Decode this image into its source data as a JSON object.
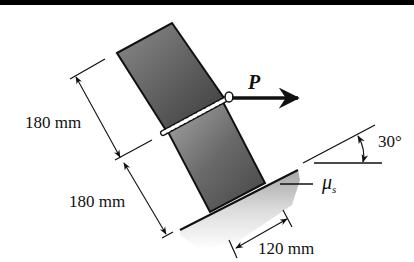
{
  "figure": {
    "top_border_color": "#000000",
    "block_color_top": "#6e6e6e",
    "block_color_bottom": "#3a3a3a",
    "outline_color": "#111111"
  },
  "labels": {
    "force": "P",
    "dim_upper": "180 mm",
    "dim_lower": "180 mm",
    "dim_base": "120 mm",
    "angle": "30°",
    "friction_symbol": "μ",
    "friction_subscript": "s"
  },
  "elements": {
    "upper_block": {
      "height_mm": 180
    },
    "lower_block": {
      "height_mm": 180
    },
    "base_width_mm": 120,
    "incline_angle_deg": 30,
    "force_direction": "horizontal right",
    "weld": "seam between blocks"
  }
}
